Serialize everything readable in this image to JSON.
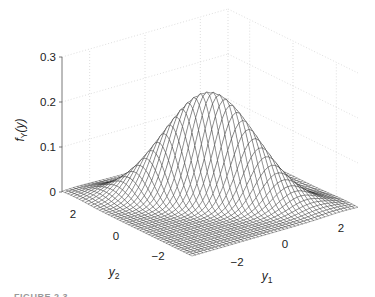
{
  "chart_data": {
    "type": "surface3d",
    "title": "",
    "zlabel": "f_Y(y)",
    "zlabel_parts": {
      "main": "f",
      "sub": "Y",
      "arg": "(y)"
    },
    "xlabel": "y1",
    "xlabel_parts": {
      "main": "y",
      "sub": "1"
    },
    "ylabel": "y2",
    "ylabel_parts": {
      "main": "y",
      "sub": "2"
    },
    "x_range": [
      -3,
      3
    ],
    "y_range": [
      -3,
      3
    ],
    "zlim": [
      0,
      0.3
    ],
    "z_ticks": [
      "0",
      "0.1",
      "0.2",
      "0.3"
    ],
    "x_ticks": [
      "−2",
      "0",
      "2"
    ],
    "y_ticks": [
      "2",
      "0",
      "−2"
    ],
    "grid": true,
    "surface": {
      "function": "bivariate normal density",
      "mean": [
        0,
        0
      ],
      "sigma1": 1.0,
      "sigma2": 1.0,
      "rho": -0.8,
      "peak_value": 0.24,
      "mesh_resolution": 45,
      "line_color": "#1a1a1a",
      "face_color": "#ffffff"
    }
  },
  "caption": {
    "text": "FIGURE 2.3"
  }
}
